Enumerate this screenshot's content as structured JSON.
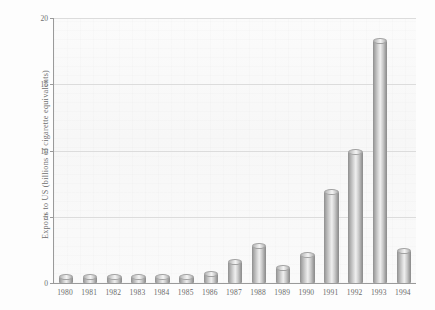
{
  "chart_data": {
    "type": "bar",
    "title": "",
    "subtitle": "",
    "xlabel": "",
    "ylabel": "Exports to US (billions of cigarette equivalents)",
    "categories": [
      "1980",
      "1981",
      "1982",
      "1983",
      "1984",
      "1985",
      "1986",
      "1987",
      "1988",
      "1989",
      "1990",
      "1991",
      "1992",
      "1993",
      "1994"
    ],
    "values": [
      0.45,
      0.45,
      0.45,
      0.45,
      0.45,
      0.45,
      0.7,
      1.6,
      2.8,
      1.1,
      2.1,
      6.9,
      9.9,
      18.3,
      2.4
    ],
    "ylim": [
      0,
      20
    ],
    "y_ticks": [
      "0",
      "5",
      "10",
      "15",
      "20"
    ],
    "y_tick_values": [
      0,
      5,
      10,
      15,
      20
    ],
    "grid": true,
    "legend": "none",
    "series_name": "Exports to US",
    "bar_style": "3d-cylinder",
    "colors": {
      "bar_light": "#efefef",
      "bar_mid": "#c9c9c9",
      "bar_dark": "#8a8a8a",
      "axis": "#9a9a9a",
      "gridline": "#dcdcdc",
      "text": "#6a6a6a",
      "plot_background": "#fafafa",
      "page_background": "#fdfdfd"
    }
  }
}
